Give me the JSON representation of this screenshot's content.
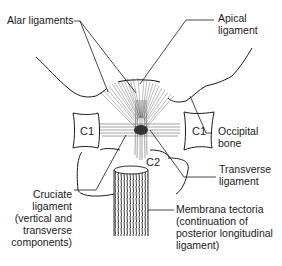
{
  "diagram": {
    "labels": {
      "alar": {
        "lines": [
          "Alar ligaments"
        ]
      },
      "apical": {
        "lines": [
          "Apical",
          "ligament"
        ]
      },
      "occipital": {
        "lines": [
          "Occipital",
          "bone"
        ]
      },
      "transverse": {
        "lines": [
          "Transverse",
          "ligament"
        ]
      },
      "cruciate": {
        "lines": [
          "Cruciate",
          "ligament",
          "(vertical and",
          "transverse",
          "components)"
        ]
      },
      "tectoria": {
        "lines": [
          "Membrana tectoria",
          "(continuation of",
          "posterior longitudinal",
          "ligament)"
        ]
      }
    },
    "bone_labels": {
      "c1_left": "C1",
      "c1_right": "C1",
      "c2": "C2"
    },
    "colors": {
      "line": "#1a1a1a",
      "fiber": "#555555",
      "background": "#ffffff"
    }
  }
}
